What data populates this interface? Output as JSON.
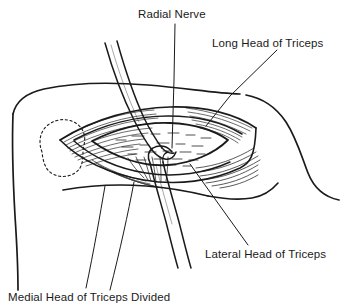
{
  "figure": {
    "background_color": "#ffffff",
    "ink_color": "#1a1a1a",
    "width": 344,
    "height": 300,
    "labels": [
      {
        "id": "radial-nerve",
        "text": "Radial Nerve",
        "x": 138,
        "y": 8
      },
      {
        "id": "long-head",
        "text": "Long Head of Triceps",
        "x": 212,
        "y": 37
      },
      {
        "id": "lateral-head",
        "text": "Lateral Head of Triceps",
        "x": 205,
        "y": 248
      },
      {
        "id": "medial-head",
        "text": "Medial Head of Triceps Divided",
        "x": 8,
        "y": 291,
        "clipped": "true"
      }
    ],
    "parts": {
      "arm_outline": "arm-outline",
      "wound": "surgical-wound-opening",
      "bone_landmark": "dotted-bone-outline",
      "upper_band": "radial-nerve-retractor-band",
      "lower_band": "lower-retractor-band"
    }
  }
}
